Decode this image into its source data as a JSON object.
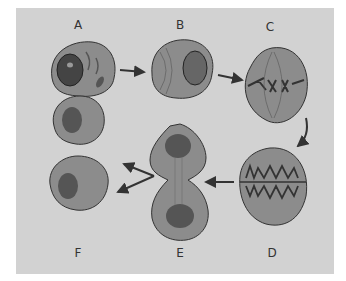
{
  "diagram": {
    "type": "cell division stages",
    "labels": {
      "A": "A",
      "B": "B",
      "C": "C",
      "D": "D",
      "E": "E",
      "F": "F"
    },
    "colors": {
      "background": "#d2d2d2",
      "cytoplasm": "#8a8a8a",
      "nucleus": "#555555",
      "outline": "#333333"
    },
    "flow": [
      "A",
      "B",
      "C",
      "D",
      "E",
      "F"
    ]
  }
}
